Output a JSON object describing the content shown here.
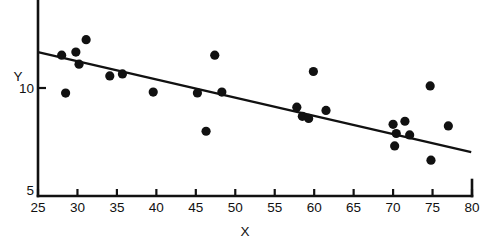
{
  "chart_data": {
    "type": "scatter",
    "title": "",
    "xlabel": "X",
    "ylabel": "Y",
    "xlim": [
      25,
      80
    ],
    "ylim": [
      5,
      12.6
    ],
    "grid": false,
    "legend": null,
    "xticks": [
      25,
      30,
      35,
      40,
      45,
      50,
      55,
      60,
      65,
      70,
      75,
      80
    ],
    "xticklabels": [
      "25",
      "30",
      "35",
      "40",
      "45",
      "50",
      "55",
      "60",
      "65",
      "70",
      "75",
      "80"
    ],
    "yticks": [
      5,
      10
    ],
    "yticklabels": [
      "5",
      "10"
    ],
    "marker": "filled-circle",
    "marker_color": "#111111",
    "points": [
      {
        "x": 28.0,
        "y": 11.61
      },
      {
        "x": 28.5,
        "y": 9.75
      },
      {
        "x": 29.8,
        "y": 11.76
      },
      {
        "x": 30.2,
        "y": 11.17
      },
      {
        "x": 31.1,
        "y": 12.37
      },
      {
        "x": 34.1,
        "y": 10.59
      },
      {
        "x": 35.7,
        "y": 10.69
      },
      {
        "x": 39.6,
        "y": 9.8
      },
      {
        "x": 45.2,
        "y": 9.76
      },
      {
        "x": 46.3,
        "y": 7.88
      },
      {
        "x": 47.4,
        "y": 11.61
      },
      {
        "x": 48.3,
        "y": 9.8
      },
      {
        "x": 57.8,
        "y": 9.06
      },
      {
        "x": 58.5,
        "y": 8.61
      },
      {
        "x": 59.3,
        "y": 8.51
      },
      {
        "x": 59.9,
        "y": 10.81
      },
      {
        "x": 61.5,
        "y": 8.9
      },
      {
        "x": 70.0,
        "y": 8.22
      },
      {
        "x": 70.2,
        "y": 7.16
      },
      {
        "x": 70.4,
        "y": 7.77
      },
      {
        "x": 71.5,
        "y": 8.37
      },
      {
        "x": 72.1,
        "y": 7.7
      },
      {
        "x": 74.7,
        "y": 10.1
      },
      {
        "x": 74.8,
        "y": 6.46
      },
      {
        "x": 77.0,
        "y": 8.14
      }
    ],
    "fit_line": {
      "type": "linear-regression",
      "x_start": 25.0,
      "y_start": 11.76,
      "x_end": 79.9,
      "y_end": 6.86,
      "color": "#111111"
    }
  },
  "labels": {
    "x_axis": "X",
    "y_axis": "Y"
  }
}
